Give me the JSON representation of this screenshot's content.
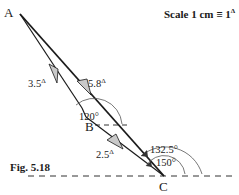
{
  "figure": {
    "caption": "Fig. 5.18",
    "scale": {
      "label": "Scale 1 cm ≡ 1",
      "unit_symbol": "Δ"
    },
    "points": {
      "A": {
        "label": "A",
        "x": 20,
        "y": 14
      },
      "B": {
        "label": "B",
        "x": 93,
        "y": 118
      },
      "C": {
        "label": "C",
        "x": 164,
        "y": 176
      }
    },
    "segments": [
      {
        "from": "A",
        "to": "B",
        "value": "3.5",
        "unit": "Δ"
      },
      {
        "from": "A",
        "to": "C",
        "value": "5.8",
        "unit": "Δ"
      },
      {
        "from": "B",
        "to": "C",
        "value": "2.5",
        "unit": "Δ"
      }
    ],
    "angles": {
      "at_B": "120°",
      "at_C_outer": "132.5°",
      "at_C_inner": "150°"
    },
    "colors": {
      "line": "#1a1a1a",
      "arrow_fill": "#c9c9c9",
      "background": "#ffffff"
    }
  }
}
